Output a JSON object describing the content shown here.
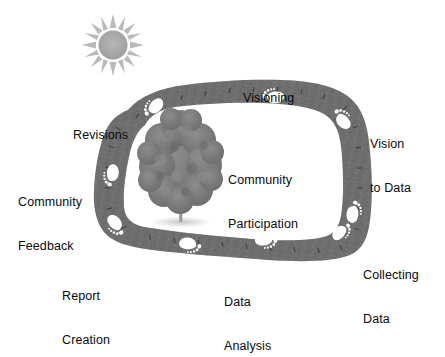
{
  "figure": {
    "center_label": "Community\nParticipation",
    "colors": {
      "path_fill": "#6f6f6f",
      "path_dark": "#555555",
      "path_texture": "#4a4a4a",
      "footprint": "#ffffff",
      "tree_foliage": "#7b7b7b",
      "tree_trunk": "#9a9a9a",
      "sun": "#a8a8a8",
      "sun_rays": "#b4b4b4",
      "text": "#0a0a0a",
      "background": "#ffffff"
    }
  },
  "icons": {
    "sun": "sun-icon",
    "tree": "tree-icon",
    "footprint": "footprint-icon",
    "path": "trail-loop-icon"
  },
  "stages": [
    {
      "id": "visioning",
      "label": "Visioning",
      "lines": [
        "Visioning"
      ],
      "x": 243,
      "y": 62,
      "align": "left"
    },
    {
      "id": "vision-to-data",
      "label": "Vision to Data",
      "lines": [
        "Vision",
        "to Data"
      ],
      "x": 370,
      "y": 108,
      "align": "left"
    },
    {
      "id": "collecting-data",
      "label": "Collecting Data",
      "lines": [
        "Collecting",
        "Data"
      ],
      "x": 363,
      "y": 239,
      "align": "left"
    },
    {
      "id": "data-analysis",
      "label": "Data Analysis",
      "lines": [
        "Data",
        "Analysis"
      ],
      "x": 224,
      "y": 266,
      "align": "left"
    },
    {
      "id": "report-creation",
      "label": "Report Creation",
      "lines": [
        "Report",
        "Creation"
      ],
      "x": 62,
      "y": 260,
      "align": "left"
    },
    {
      "id": "community-feedback",
      "label": "Community Feedback",
      "lines": [
        "Community",
        "Feedback"
      ],
      "x": 18,
      "y": 166,
      "align": "left"
    },
    {
      "id": "revisions",
      "label": "Revisions",
      "lines": [
        "Revisions"
      ],
      "x": 73,
      "y": 99,
      "align": "left"
    },
    {
      "id": "community-participation",
      "label": "Community Participation",
      "lines": [
        "Community",
        "Participation"
      ],
      "x": 228,
      "y": 144,
      "align": "left"
    }
  ]
}
